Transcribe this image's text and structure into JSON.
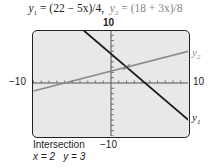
{
  "title": {
    "y1_label": "y",
    "y1_sub": "1",
    "y1_expr": " = (22 − 5x)/4,",
    "y2_label": "y",
    "y2_sub": "2",
    "y2_expr": " = (18 + 3x)/8"
  },
  "axes": {
    "x_min_label": "−10",
    "x_max_label": "10",
    "y_max_label": "10",
    "y_min_label": "−10"
  },
  "series_labels": {
    "y1": "y",
    "y1_sub": "1",
    "y2": "y",
    "y2_sub": "2"
  },
  "result": {
    "heading": "Intersection",
    "x_text": "x = 2",
    "y_text": "y = 3"
  },
  "colors": {
    "y1_line": "#1a1a1a",
    "y2_line": "#8a8a8a",
    "screen_bg": "#e8e8e8",
    "frame": "#222222"
  },
  "chart_data": {
    "type": "line",
    "xlabel": "",
    "ylabel": "",
    "xlim": [
      -10,
      10
    ],
    "ylim": [
      -10,
      10
    ],
    "x_ticks_step": 1,
    "y_ticks_step": 1,
    "grid": false,
    "legend": "inline labels at right edge",
    "series": [
      {
        "name": "y1",
        "equation": "(22 - 5x)/4",
        "x": [
          -3.6,
          10
        ],
        "y": [
          10,
          -7
        ],
        "color": "#1a1a1a"
      },
      {
        "name": "y2",
        "equation": "(18 + 3x)/8",
        "x": [
          -10,
          10
        ],
        "y": [
          -1.5,
          6
        ],
        "color": "#8a8a8a"
      }
    ],
    "annotations": [
      {
        "type": "intersection",
        "x": 2,
        "y": 3,
        "label": "Intersection x = 2 y = 3"
      }
    ]
  }
}
